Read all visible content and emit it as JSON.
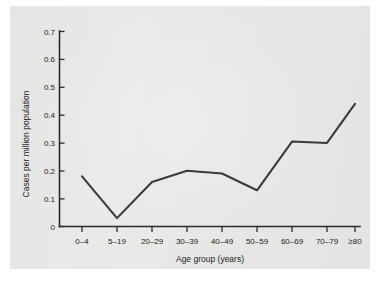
{
  "chart_data": {
    "type": "line",
    "title": "",
    "xlabel": "Age group (years)",
    "ylabel": "Cases per million population",
    "categories": [
      "0–4",
      "5–19",
      "20–29",
      "30–39",
      "40–49",
      "50–59",
      "60–69",
      "70–79",
      "≥80"
    ],
    "values": [
      0.18,
      0.03,
      0.16,
      0.2,
      0.19,
      0.13,
      0.305,
      0.3,
      0.44
    ],
    "series": [
      {
        "name": "Cases per million population",
        "values": [
          0.18,
          0.03,
          0.16,
          0.2,
          0.19,
          0.13,
          0.305,
          0.3,
          0.44
        ]
      }
    ],
    "ylim": [
      0,
      0.7
    ],
    "ytick_labels": [
      "0.7",
      "0.6",
      "0.5",
      "0.4",
      "0.3",
      "0.2",
      "0.1",
      "0"
    ],
    "ytick_values": [
      0.7,
      0.6,
      0.5,
      0.4,
      0.3,
      0.2,
      0.1,
      0
    ],
    "grid": false,
    "legend": "none",
    "line_color": "#3b3b3b",
    "axis_color": "#2a2a2a",
    "background_color": "#e9e9e7",
    "markers": false
  }
}
